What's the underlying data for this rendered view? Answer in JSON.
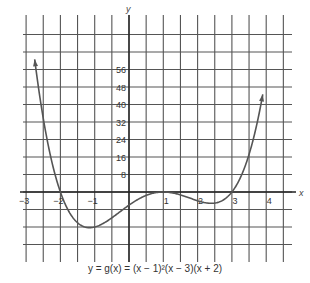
{
  "chart_data": {
    "type": "line",
    "title": "",
    "caption": "y = g(x) = (x − 1)²(x − 3)(x + 2)",
    "xlabel": "x",
    "ylabel": "y",
    "x_ticks": [
      -3,
      -2,
      -1,
      1,
      2,
      3,
      4
    ],
    "y_ticks": [
      8,
      16,
      24,
      32,
      40,
      48,
      56
    ],
    "y_tick_labels": [
      "8",
      "16",
      "24",
      "32",
      "40",
      "48",
      "56"
    ],
    "xlim": [
      -3.0,
      4.5
    ],
    "ylim": [
      -24,
      64
    ],
    "grid": true,
    "legend": null,
    "series": [
      {
        "name": "g(x) = (x-1)^2 (x-3)(x+2)",
        "color": "#555555",
        "x": [
          -2.75,
          -2.5,
          -2,
          -1.5,
          -1,
          -0.5,
          0,
          0.5,
          1,
          1.5,
          2,
          2.5,
          3,
          3.5,
          3.9
        ],
        "y": [
          58.8,
          33.8,
          0,
          -13.1,
          -16,
          -11.8,
          -6,
          -1.8,
          0,
          -1.1,
          -4,
          -3.4,
          0,
          17,
          52.6
        ]
      }
    ],
    "annotations": {
      "roots": [
        -2,
        1,
        3
      ],
      "arrows_at_ends": true
    }
  },
  "colors": {
    "grid": "#555555",
    "curve": "#666666",
    "text": "#333333"
  }
}
